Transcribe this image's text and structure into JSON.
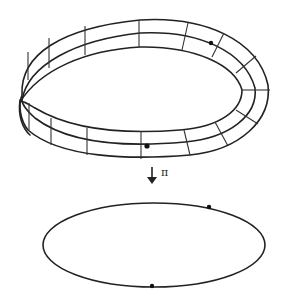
{
  "diagram": {
    "upper_figure": "mobius-band",
    "lower_figure": "circle-ellipse",
    "map_label": "π",
    "arrow_direction": "down",
    "colors": {
      "stroke": "#222222",
      "background": "#ffffff"
    },
    "points": {
      "band_dots": [
        [
          147,
          146
        ],
        [
          211,
          43
        ]
      ],
      "circle_dots": [
        [
          209,
          207
        ],
        [
          152,
          286
        ]
      ]
    }
  }
}
